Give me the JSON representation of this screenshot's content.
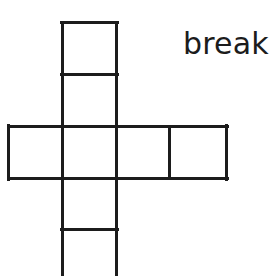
{
  "canvas": {
    "width": 270,
    "height": 276,
    "background_color": "#ffffff"
  },
  "annotation": {
    "label": "break",
    "color": "#1c1c1c",
    "x": 183,
    "y": 28,
    "font_size_px": 30
  },
  "figure": {
    "name": "cube-net-cross",
    "stroke_color": "#1c1c1c",
    "stroke_width": 3,
    "geometry": {
      "column_left_x": 62,
      "column_right_x": 116,
      "band_left_x": 8,
      "band_right_x": 226,
      "band_divider_x": 169,
      "top_y": 22,
      "divider_upper_y": 74,
      "band_top_y": 126,
      "band_bottom_y": 178,
      "divider_lower_y": 229,
      "bottom_y": 280
    },
    "segments": [
      {
        "name": "column-left-edge",
        "x1": 62,
        "y1": 22,
        "x2": 62,
        "y2": 280
      },
      {
        "name": "column-right-edge",
        "x1": 116,
        "y1": 22,
        "x2": 116,
        "y2": 280
      },
      {
        "name": "column-top-edge",
        "x1": 62,
        "y1": 22,
        "x2": 116,
        "y2": 22
      },
      {
        "name": "column-divider-upper",
        "x1": 62,
        "y1": 74,
        "x2": 116,
        "y2": 74
      },
      {
        "name": "band-top-edge",
        "x1": 8,
        "y1": 126,
        "x2": 226,
        "y2": 126
      },
      {
        "name": "band-bottom-edge",
        "x1": 8,
        "y1": 178,
        "x2": 226,
        "y2": 178
      },
      {
        "name": "band-left-edge",
        "x1": 8,
        "y1": 126,
        "x2": 8,
        "y2": 178
      },
      {
        "name": "band-right-edge",
        "x1": 226,
        "y1": 126,
        "x2": 226,
        "y2": 178
      },
      {
        "name": "band-divider-right",
        "x1": 169,
        "y1": 126,
        "x2": 169,
        "y2": 178
      },
      {
        "name": "column-divider-lower",
        "x1": 62,
        "y1": 229,
        "x2": 116,
        "y2": 229
      }
    ],
    "faces": [
      {
        "name": "face-top",
        "row": 0,
        "col": 1
      },
      {
        "name": "face-upper-middle",
        "row": 1,
        "col": 1
      },
      {
        "name": "face-band-left",
        "row": 2,
        "col": 0
      },
      {
        "name": "face-band-center",
        "row": 2,
        "col": 1
      },
      {
        "name": "face-band-right",
        "row": 2,
        "col": 2
      },
      {
        "name": "face-band-far-right",
        "row": 2,
        "col": 3
      },
      {
        "name": "face-lower-middle",
        "row": 3,
        "col": 1
      },
      {
        "name": "face-bottom",
        "row": 4,
        "col": 1
      }
    ]
  }
}
